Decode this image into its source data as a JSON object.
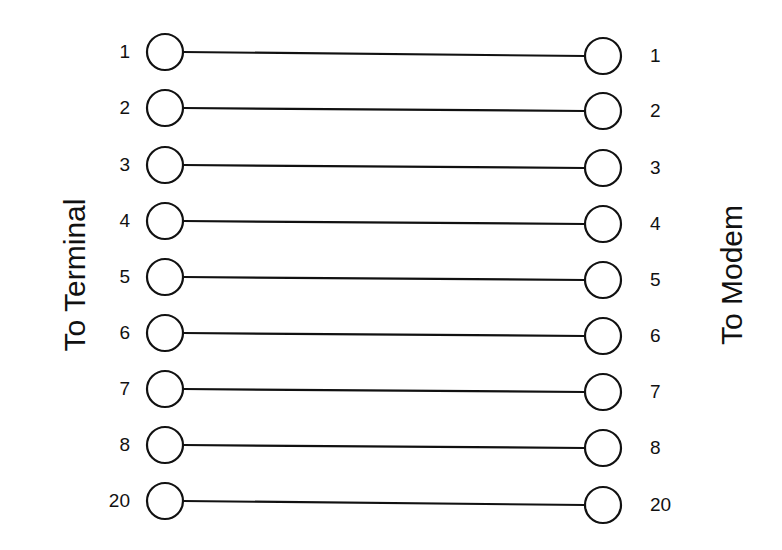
{
  "diagram": {
    "left_label": "To Terminal",
    "right_label": "To Modem",
    "connections": [
      {
        "left_pin": "1",
        "right_pin": "1",
        "y_left": 52,
        "y_right": 56
      },
      {
        "left_pin": "2",
        "right_pin": "2",
        "y_left": 108,
        "y_right": 111
      },
      {
        "left_pin": "3",
        "right_pin": "3",
        "y_left": 165,
        "y_right": 168
      },
      {
        "left_pin": "4",
        "right_pin": "4",
        "y_left": 221,
        "y_right": 224
      },
      {
        "left_pin": "5",
        "right_pin": "5",
        "y_left": 277,
        "y_right": 280
      },
      {
        "left_pin": "6",
        "right_pin": "6",
        "y_left": 333,
        "y_right": 336
      },
      {
        "left_pin": "7",
        "right_pin": "7",
        "y_left": 389,
        "y_right": 392
      },
      {
        "left_pin": "8",
        "right_pin": "8",
        "y_left": 445,
        "y_right": 448
      },
      {
        "left_pin": "20",
        "right_pin": "20",
        "y_left": 501,
        "y_right": 505
      }
    ],
    "colors": {
      "line": "#111111",
      "background": "#ffffff"
    }
  }
}
